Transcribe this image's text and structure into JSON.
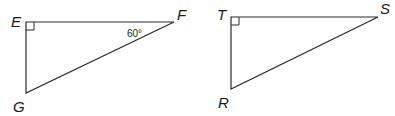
{
  "triangles": [
    {
      "name": "EFG",
      "vertices": {
        "E": "E",
        "F": "F",
        "G": "G"
      },
      "right_angle_at": "E",
      "angle_label": "60°",
      "angle_at": "F"
    },
    {
      "name": "TSR",
      "vertices": {
        "T": "T",
        "S": "S",
        "R": "R"
      },
      "right_angle_at": "T"
    }
  ]
}
